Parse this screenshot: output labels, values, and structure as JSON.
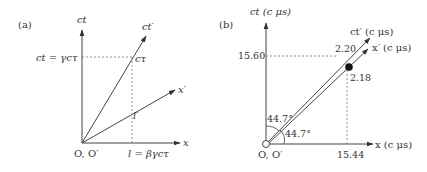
{
  "panel_a": {
    "tag": "(a)",
    "axis_ct": "ct",
    "axis_x": "x",
    "axis_ct_prime": "ct′",
    "axis_x_prime": "x′",
    "origin": "O, O′",
    "ct_eq": "ct = γcτ",
    "l_eq": "l = βγcτ",
    "point_ctau": "cτ",
    "point_l_prime": "l′"
  },
  "panel_b": {
    "tag": "(b)",
    "axis_ct": "ct (c μs)",
    "axis_x": "x (c μs)",
    "axis_ct_prime": "ct′ (c μs)",
    "axis_x_prime": "x′ (c μs)",
    "origin": "O, O′",
    "ct_value": "15.60",
    "x_value": "15.44",
    "ct_prime_value": "2.20",
    "x_prime_value": "2.18",
    "angle_top": "44.7°",
    "angle_bottom": "44.7°"
  },
  "colors": {
    "line": "#444444",
    "dash": "#777777",
    "text": "#333333"
  }
}
